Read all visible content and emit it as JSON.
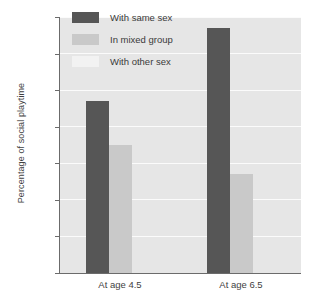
{
  "chart_data": {
    "type": "bar",
    "title": "",
    "xlabel": "",
    "ylabel": "Percentage of social playtime",
    "categories": [
      "At age 4.5",
      "At age 6.5"
    ],
    "series": [
      {
        "name": "With same sex",
        "color": "#565656",
        "values": [
          47,
          67
        ]
      },
      {
        "name": "In mixed group",
        "color": "#c9c9c9",
        "values": [
          35,
          27
        ]
      },
      {
        "name": "With other sex",
        "color": "#f2f2f2",
        "values": [
          0,
          0
        ]
      }
    ],
    "ylim": [
      0,
      70
    ],
    "yticks": [
      0,
      10,
      20,
      30,
      40,
      50,
      60,
      70
    ],
    "ytick_labels": [
      "0",
      "10",
      "20",
      "30",
      "40",
      "50",
      "60",
      "70"
    ],
    "grid": true,
    "grid_orientation": "horizontal",
    "legend_position": "top-left-inside",
    "plot_background": "#e6e6e6",
    "axis_color": "#6b6b6b"
  },
  "axes": {
    "y_title": "Percentage of social playtime",
    "ticks": [
      {
        "value": 70,
        "label": "70"
      },
      {
        "value": 60,
        "label": "60"
      },
      {
        "value": 50,
        "label": "50"
      },
      {
        "value": 40,
        "label": "40"
      },
      {
        "value": 30,
        "label": "30"
      },
      {
        "value": 20,
        "label": "20"
      },
      {
        "value": 10,
        "label": "10"
      },
      {
        "value": 0,
        "label": "0"
      }
    ],
    "categories": [
      {
        "label": "At age 4.5"
      },
      {
        "label": "At age 6.5"
      }
    ]
  },
  "legend": {
    "entries": [
      {
        "label": "With same sex",
        "color": "#565656"
      },
      {
        "label": "In mixed group",
        "color": "#c9c9c9"
      },
      {
        "label": "With other sex",
        "color": "#f2f2f2"
      }
    ]
  }
}
